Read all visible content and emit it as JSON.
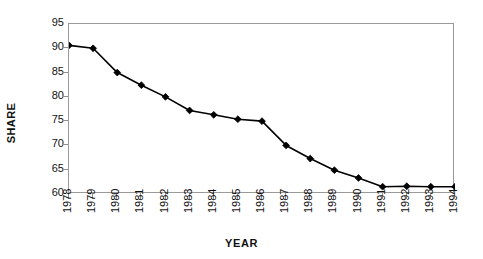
{
  "chart_data": {
    "type": "line",
    "title": "",
    "xlabel": "YEAR",
    "ylabel": "SHARE",
    "x": [
      1978,
      1979,
      1980,
      1981,
      1982,
      1983,
      1984,
      1985,
      1986,
      1987,
      1988,
      1989,
      1990,
      1991,
      1992,
      1993,
      1994
    ],
    "xtick_labels": [
      "1978",
      "1979",
      "1980",
      "1981",
      "1982",
      "1983",
      "1984",
      "1985",
      "1986",
      "1987",
      "1988",
      "1989",
      "1990",
      "1991",
      "1992",
      "1993",
      "1994"
    ],
    "values": [
      90.6,
      90.0,
      85.0,
      82.4,
      80.0,
      77.2,
      76.3,
      75.4,
      75.0,
      70.0,
      67.3,
      64.9,
      63.3,
      61.5,
      61.6,
      61.5,
      61.5
    ],
    "ytick_labels": [
      "95",
      "90",
      "85",
      "80",
      "75",
      "70",
      "65",
      "60"
    ],
    "yticks": [
      95,
      90,
      85,
      80,
      75,
      70,
      65,
      60
    ],
    "ylim": [
      60,
      95
    ],
    "xlim": [
      1978,
      1994
    ],
    "grid": false,
    "legend": false,
    "legend_position": "none",
    "marker": "diamond",
    "line_color": "#000000",
    "marker_color": "#000000",
    "frame_color": "#9a9a9a",
    "background_color": "#ffffff",
    "annotations": []
  }
}
